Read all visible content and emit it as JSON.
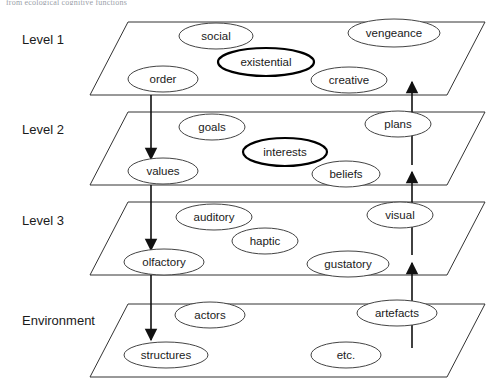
{
  "figure": {
    "top_caption": "from ecological cognitive functions",
    "background_color": "#ffffff",
    "line_color": "#333333",
    "bold_outline_color": "#000000"
  },
  "levels": [
    {
      "label": "Level 1",
      "label_x": 22,
      "label_y": 41,
      "plane": "90,95 128,22 485,22 447,95",
      "nodes": [
        {
          "name": "social",
          "cx": 216,
          "cy": 36,
          "rx": 37,
          "ry": 13,
          "bold": false
        },
        {
          "name": "vengeance",
          "cx": 394,
          "cy": 33,
          "rx": 46,
          "ry": 14,
          "bold": false
        },
        {
          "name": "existential",
          "cx": 266,
          "cy": 62,
          "rx": 48,
          "ry": 14,
          "bold": true
        },
        {
          "name": "order",
          "cx": 163,
          "cy": 79,
          "rx": 35,
          "ry": 13,
          "bold": false
        },
        {
          "name": "creative",
          "cx": 349,
          "cy": 80,
          "rx": 38,
          "ry": 13,
          "bold": false
        }
      ]
    },
    {
      "label": "Level 2",
      "label_x": 22,
      "label_y": 131,
      "plane": "90,185 128,112 485,112 447,185",
      "nodes": [
        {
          "name": "goals",
          "cx": 212,
          "cy": 127,
          "rx": 33,
          "ry": 13,
          "bold": false
        },
        {
          "name": "plans",
          "cx": 398,
          "cy": 124,
          "rx": 33,
          "ry": 13,
          "bold": false
        },
        {
          "name": "interests",
          "cx": 285,
          "cy": 152,
          "rx": 42,
          "ry": 14,
          "bold": true
        },
        {
          "name": "values",
          "cx": 163,
          "cy": 171,
          "rx": 35,
          "ry": 13,
          "bold": false
        },
        {
          "name": "beliefs",
          "cx": 346,
          "cy": 174,
          "rx": 34,
          "ry": 13,
          "bold": false
        }
      ]
    },
    {
      "label": "Level 3",
      "label_x": 22,
      "label_y": 222,
      "plane": "90,275 128,202 485,202 447,275",
      "nodes": [
        {
          "name": "auditory",
          "cx": 214,
          "cy": 217,
          "rx": 38,
          "ry": 13,
          "bold": false
        },
        {
          "name": "visual",
          "cx": 400,
          "cy": 215,
          "rx": 33,
          "ry": 13,
          "bold": false
        },
        {
          "name": "haptic",
          "cx": 265,
          "cy": 241,
          "rx": 33,
          "ry": 13,
          "bold": false
        },
        {
          "name": "olfactory",
          "cx": 164,
          "cy": 262,
          "rx": 40,
          "ry": 13,
          "bold": false
        },
        {
          "name": "gustatory",
          "cx": 348,
          "cy": 264,
          "rx": 41,
          "ry": 13,
          "bold": false
        }
      ]
    },
    {
      "label": "Environment",
      "label_x": 22,
      "label_y": 322,
      "plane": "90,377 128,304 485,304 447,377",
      "nodes": [
        {
          "name": "actors",
          "cx": 210,
          "cy": 315,
          "rx": 35,
          "ry": 13,
          "bold": false
        },
        {
          "name": "artefacts",
          "cx": 397,
          "cy": 313,
          "rx": 40,
          "ry": 13,
          "bold": false
        },
        {
          "name": "structures",
          "cx": 166,
          "cy": 355,
          "rx": 42,
          "ry": 13,
          "bold": false
        },
        {
          "name": "etc.",
          "cx": 346,
          "cy": 355,
          "rx": 35,
          "ry": 13,
          "bold": false
        }
      ]
    }
  ],
  "arrows_down": [
    {
      "x": 151,
      "y1": 95,
      "y2": 159,
      "label": "level1-to-level2"
    },
    {
      "x": 151,
      "y1": 185,
      "y2": 250,
      "label": "level2-to-level3"
    },
    {
      "x": 151,
      "y1": 275,
      "y2": 340,
      "label": "level3-to-environment"
    }
  ],
  "arrows_up": [
    {
      "x": 412,
      "y1": 165,
      "y2": 82,
      "label": "level2-to-level1"
    },
    {
      "x": 412,
      "y1": 255,
      "y2": 172,
      "label": "level3-to-level2"
    },
    {
      "x": 412,
      "y1": 348,
      "y2": 263,
      "label": "environment-to-level3"
    }
  ]
}
